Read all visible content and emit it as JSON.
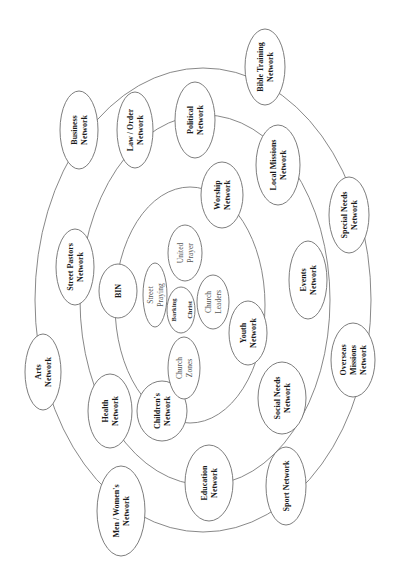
{
  "diagram": {
    "orientation": "rotated-90-ccw",
    "colors": {
      "background": "#ffffff",
      "ring_stroke": "#7a7a7a",
      "node_stroke": "#6e6e6e",
      "text_primary": "#1a1a1a",
      "text_inner": "#555555"
    },
    "rings": [
      {
        "name": "outer-ring",
        "cx": 203,
        "cy": 300,
        "rx": 168,
        "ry": 232
      },
      {
        "name": "middle-ring",
        "cx": 205,
        "cy": 300,
        "rx": 125,
        "ry": 185
      },
      {
        "name": "inner-ring",
        "cx": 190,
        "cy": 305,
        "rx": 75,
        "ry": 118
      }
    ],
    "nodes": [
      {
        "id": "business-network",
        "ring": "outer",
        "lines": [
          "Business",
          "Network"
        ],
        "cx": 79,
        "cy": 130,
        "rx": 19,
        "ry": 39
      },
      {
        "id": "bible-training-network",
        "ring": "outer",
        "lines": [
          "Bible Training",
          "Network"
        ],
        "cx": 265,
        "cy": 67,
        "rx": 20,
        "ry": 38
      },
      {
        "id": "special-needs-network",
        "ring": "outer",
        "lines": [
          "Special Needs",
          "Network"
        ],
        "cx": 349,
        "cy": 215,
        "rx": 20,
        "ry": 38
      },
      {
        "id": "overseas-missions-network",
        "ring": "outer",
        "lines": [
          "Overseas",
          "Missions",
          "Network"
        ],
        "cx": 353,
        "cy": 360,
        "rx": 22,
        "ry": 37
      },
      {
        "id": "sport-network",
        "ring": "outer",
        "lines": [
          "Sport Network"
        ],
        "cx": 286,
        "cy": 486,
        "rx": 20,
        "ry": 39
      },
      {
        "id": "men-womens-network",
        "ring": "outer",
        "lines": [
          "Men / Women's",
          "Network"
        ],
        "cx": 121,
        "cy": 511,
        "rx": 24,
        "ry": 45
      },
      {
        "id": "arts-network",
        "ring": "outer",
        "lines": [
          "Arts",
          "Network"
        ],
        "cx": 43,
        "cy": 372,
        "rx": 18,
        "ry": 38
      },
      {
        "id": "law-order-network",
        "ring": "middle",
        "lines": [
          "Law / Order",
          "Network"
        ],
        "cx": 135,
        "cy": 130,
        "rx": 18,
        "ry": 38
      },
      {
        "id": "political-network",
        "ring": "middle",
        "lines": [
          "Political",
          "Network"
        ],
        "cx": 195,
        "cy": 120,
        "rx": 20,
        "ry": 38
      },
      {
        "id": "local-missions-network",
        "ring": "middle",
        "lines": [
          "Local Missions",
          "Network"
        ],
        "cx": 278,
        "cy": 165,
        "rx": 22,
        "ry": 40
      },
      {
        "id": "events-network",
        "ring": "middle",
        "lines": [
          "Events",
          "Network"
        ],
        "cx": 308,
        "cy": 280,
        "rx": 19,
        "ry": 39
      },
      {
        "id": "social-needs-network",
        "ring": "middle",
        "lines": [
          "Social Needs",
          "Network"
        ],
        "cx": 282,
        "cy": 398,
        "rx": 24,
        "ry": 36
      },
      {
        "id": "education-network",
        "ring": "middle",
        "lines": [
          "Education",
          "Network"
        ],
        "cx": 209,
        "cy": 483,
        "rx": 24,
        "ry": 38
      },
      {
        "id": "health-network",
        "ring": "middle",
        "lines": [
          "Health",
          "Network"
        ],
        "cx": 110,
        "cy": 411,
        "rx": 22,
        "ry": 37
      },
      {
        "id": "street-pastors-network",
        "ring": "middle",
        "lines": [
          "Street Pastors",
          "Network"
        ],
        "cx": 75,
        "cy": 267,
        "rx": 19,
        "ry": 38
      },
      {
        "id": "worship-network",
        "ring": "inner",
        "lines": [
          "Worship",
          "Network"
        ],
        "cx": 222,
        "cy": 195,
        "rx": 21,
        "ry": 33
      },
      {
        "id": "youth-network",
        "ring": "inner",
        "lines": [
          "Youth",
          "Network"
        ],
        "cx": 248,
        "cy": 333,
        "rx": 19,
        "ry": 32
      },
      {
        "id": "childrens-network",
        "ring": "inner",
        "lines": [
          "Children's",
          "Network"
        ],
        "cx": 162,
        "cy": 411,
        "rx": 25,
        "ry": 30
      },
      {
        "id": "bin",
        "ring": "inner",
        "lines": [
          "BIN"
        ],
        "cx": 118,
        "cy": 291,
        "rx": 19,
        "ry": 27
      }
    ],
    "core_nodes": [
      {
        "id": "street-praying",
        "lines": [
          "Street",
          "Praying"
        ],
        "cx": 155,
        "cy": 295,
        "rx": 12,
        "ry": 32,
        "style": "inner"
      },
      {
        "id": "united-prayer",
        "lines": [
          "United",
          "Prayer"
        ],
        "cx": 185,
        "cy": 253,
        "rx": 17,
        "ry": 28,
        "style": "inner"
      },
      {
        "id": "church-leaders",
        "lines": [
          "Church",
          "Leaders"
        ],
        "cx": 213,
        "cy": 302,
        "rx": 16,
        "ry": 27,
        "style": "inner"
      },
      {
        "id": "church-zones",
        "lines": [
          "Church",
          "Zones"
        ],
        "cx": 184,
        "cy": 368,
        "rx": 16,
        "ry": 31,
        "style": "inner"
      },
      {
        "id": "barking-christ",
        "lines": [
          "Barking",
          "Christ"
        ],
        "cx": 181,
        "cy": 310,
        "rx": 14,
        "ry": 23,
        "style": "core"
      }
    ]
  }
}
